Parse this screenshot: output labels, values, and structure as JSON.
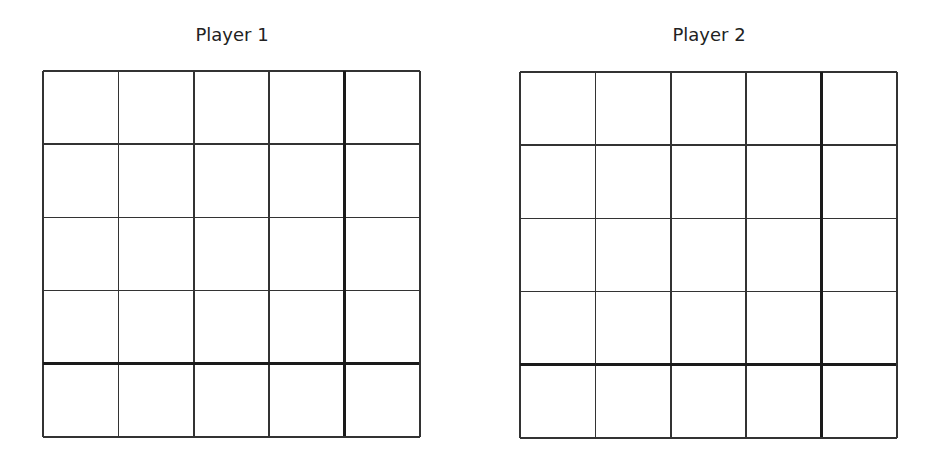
{
  "boards": [
    {
      "title": "Player 1",
      "left": 43,
      "top": 71,
      "rows": 5,
      "cols": 5
    },
    {
      "title": "Player 2",
      "left": 520,
      "top": 72,
      "rows": 5,
      "cols": 5
    }
  ],
  "colors": {
    "line": "#333333",
    "thick_line": "#1a1a1a",
    "background": "#ffffff"
  }
}
